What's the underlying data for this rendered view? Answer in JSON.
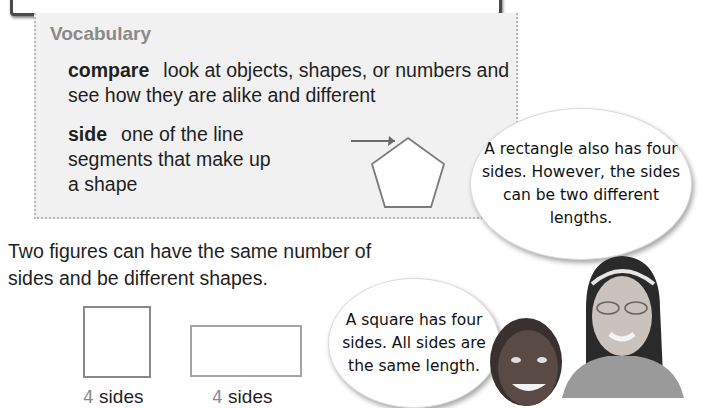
{
  "vocabulary": {
    "title": "Vocabulary",
    "terms": [
      {
        "word": "compare",
        "definition": "look at objects, shapes, or numbers and see how they are alike and different"
      },
      {
        "word": "side",
        "definition": "one of the line segments that make up a shape"
      }
    ],
    "illustration": "pentagon-with-arrow-pointing-to-side"
  },
  "lesson": {
    "text": "Two figures can have the same number of sides and be different shapes.",
    "figures": [
      {
        "shape": "square",
        "sides_number": "4",
        "sides_label": "sides"
      },
      {
        "shape": "rectangle",
        "sides_number": "4",
        "sides_label": "sides"
      }
    ]
  },
  "speech_bubbles": [
    {
      "speaker": "girl",
      "text": "A rectangle also has four sides. However, the sides can be two different lengths."
    },
    {
      "speaker": "boy",
      "text": "A square has four sides. All sides are the same length."
    }
  ],
  "colors": {
    "vocab_background": "#f1f1f1",
    "vocab_title": "#8a8a8a",
    "frame_border": "#4a4a4a"
  }
}
